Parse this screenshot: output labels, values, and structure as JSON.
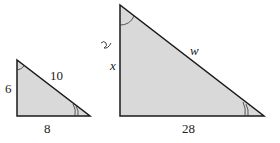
{
  "diagram": {
    "small_triangle": {
      "vertical_side": "6",
      "hypotenuse": "10",
      "base": "8"
    },
    "large_triangle": {
      "vertical_side": "x",
      "hypotenuse": "w",
      "base": "28"
    },
    "annotation_mark": "~",
    "colors": {
      "fill": "#d9d9d9",
      "stroke": "#1a1a1a"
    }
  }
}
